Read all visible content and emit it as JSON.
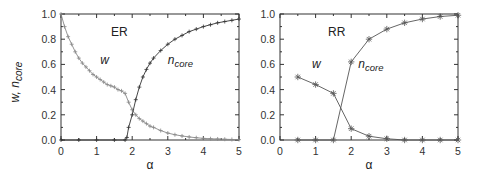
{
  "chart_data": [
    {
      "type": "line",
      "panel_label": "ER",
      "xlabel": "α",
      "ylabel": "w, n_core",
      "xlim": [
        0,
        5
      ],
      "ylim": [
        0,
        1
      ],
      "xticks": [
        "0",
        "1",
        "2",
        "3",
        "4",
        "5"
      ],
      "yticks": [
        "0.0",
        "0.2",
        "0.4",
        "0.6",
        "0.8",
        "1.0"
      ],
      "grid": false,
      "series": [
        {
          "name": "w",
          "marker": "+",
          "color": "#888888",
          "x": [
            0,
            0.1,
            0.2,
            0.3,
            0.4,
            0.5,
            0.6,
            0.7,
            0.8,
            0.9,
            1.0,
            1.1,
            1.2,
            1.3,
            1.4,
            1.5,
            1.6,
            1.7,
            1.8,
            1.9,
            2.0,
            2.1,
            2.2,
            2.3,
            2.4,
            2.5,
            2.6,
            2.8,
            3.0,
            3.2,
            3.4,
            3.6,
            3.8,
            4.0,
            4.2,
            4.4,
            4.6,
            4.8,
            5.0
          ],
          "y": [
            1.0,
            0.9,
            0.82,
            0.76,
            0.7,
            0.65,
            0.61,
            0.58,
            0.55,
            0.52,
            0.5,
            0.48,
            0.46,
            0.44,
            0.43,
            0.42,
            0.4,
            0.39,
            0.37,
            0.3,
            0.24,
            0.2,
            0.17,
            0.15,
            0.13,
            0.11,
            0.1,
            0.075,
            0.055,
            0.042,
            0.032,
            0.024,
            0.018,
            0.013,
            0.01,
            0.008,
            0.006,
            0.004,
            0.003
          ]
        },
        {
          "name": "n_core",
          "marker": "+",
          "color": "#333333",
          "x": [
            0,
            0.5,
            1.0,
            1.5,
            1.8,
            1.85,
            1.9,
            2.0,
            2.1,
            2.2,
            2.3,
            2.4,
            2.5,
            2.6,
            2.8,
            3.0,
            3.2,
            3.4,
            3.6,
            3.8,
            4.0,
            4.2,
            4.4,
            4.6,
            4.8,
            5.0
          ],
          "y": [
            0,
            0,
            0,
            0,
            0,
            0.02,
            0.1,
            0.2,
            0.32,
            0.42,
            0.5,
            0.56,
            0.61,
            0.65,
            0.71,
            0.76,
            0.8,
            0.83,
            0.86,
            0.88,
            0.9,
            0.915,
            0.93,
            0.94,
            0.95,
            0.96
          ]
        }
      ],
      "annotations": [
        {
          "text": "w",
          "x": 1.1,
          "y": 0.6
        },
        {
          "text": "n_core",
          "x": 3.0,
          "y": 0.6
        }
      ]
    },
    {
      "type": "line",
      "panel_label": "RR",
      "xlabel": "α",
      "ylabel": "",
      "xlim": [
        0,
        5
      ],
      "ylim": [
        0,
        1
      ],
      "xticks": [
        "0",
        "1",
        "2",
        "3",
        "4",
        "5"
      ],
      "yticks": [
        "0.0",
        "0.2",
        "0.4",
        "0.6",
        "0.8",
        "1.0"
      ],
      "grid": false,
      "series": [
        {
          "name": "w",
          "marker": "*",
          "color": "#555555",
          "x": [
            0.5,
            1.0,
            1.5,
            2.0,
            2.5,
            3.0,
            3.5,
            4.0,
            4.5,
            5.0
          ],
          "y": [
            0.5,
            0.44,
            0.37,
            0.09,
            0.03,
            0.01,
            0.0,
            0.0,
            0.0,
            0.0
          ]
        },
        {
          "name": "n_core",
          "marker": "*",
          "color": "#555555",
          "x": [
            0.5,
            1.0,
            1.5,
            2.0,
            2.5,
            3.0,
            3.5,
            4.0,
            4.5,
            5.0
          ],
          "y": [
            0,
            0,
            0,
            0.62,
            0.8,
            0.88,
            0.93,
            0.96,
            0.98,
            0.99
          ]
        }
      ],
      "annotations": [
        {
          "text": "w",
          "x": 0.9,
          "y": 0.57
        },
        {
          "text": "n_core",
          "x": 2.2,
          "y": 0.57
        }
      ]
    }
  ],
  "labels": {
    "left_panel": "ER",
    "right_panel": "RR",
    "xlabel": "α",
    "ylabel_w": "w,",
    "ylabel_n": "n",
    "ylabel_sub": "core",
    "w": "w",
    "n": "n",
    "core": "core"
  }
}
